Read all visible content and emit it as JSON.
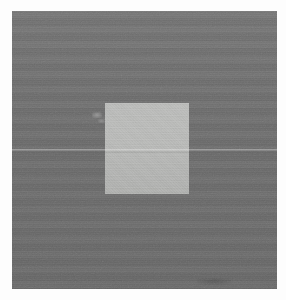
{
  "figure": {
    "kind": "grayscale-contrast-stimulus",
    "canvas": {
      "width_px": 286,
      "height_px": 300,
      "page_background": "#fdfdfd"
    },
    "surround_field": {
      "label": "surround field",
      "fill": "#6d6d6d",
      "x_px": 12,
      "y_px": 11,
      "width_px": 265,
      "height_px": 278
    },
    "test_patch": {
      "label": "test patch",
      "fill": "#b8b9b7",
      "x_px": 105,
      "y_px": 103,
      "width_px": 84,
      "height_px": 91
    },
    "seam_line": {
      "label": "horizontal scan seam",
      "y_px": 149,
      "thickness_px": 2,
      "tone": "lighter than surround"
    },
    "artifacts": [
      {
        "label": "scan blemish",
        "x_px": 92,
        "y_px": 112,
        "width_px": 10,
        "height_px": 6
      },
      {
        "label": "edge smudge",
        "x_px": 197,
        "y_px": 278,
        "width_px": 34,
        "height_px": 7
      }
    ]
  },
  "chart_data": {
    "type": "heatmap",
    "title": "",
    "xlabel": "",
    "ylabel": "",
    "grid": false,
    "legend": "none",
    "colorscale": "grayscale",
    "regions": [
      {
        "name": "surround field",
        "gray_value": 109,
        "hex": "#6d6d6d",
        "area_fraction": 0.9
      },
      {
        "name": "test patch",
        "gray_value": 184,
        "hex": "#b8b9b7",
        "area_fraction": 0.1
      }
    ],
    "annotations": [
      {
        "name": "horizontal seam line",
        "y_px": 149,
        "gray_value": 140
      }
    ]
  }
}
